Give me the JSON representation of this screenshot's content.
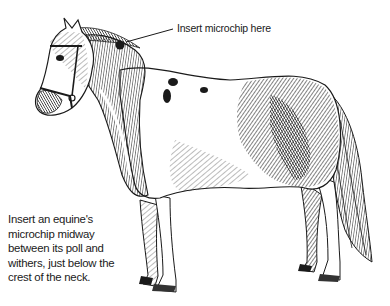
{
  "figure": {
    "style": "pen-and-ink hatching",
    "colors": {
      "ink": "#1a1a1a",
      "background": "#ffffff"
    },
    "callout": {
      "label": "Insert microchip here",
      "marker": "microchip-site-dot"
    },
    "caption": {
      "lines": [
        "Insert an equine's",
        "microchip midway",
        "between its poll and",
        "withers, just below the",
        "crest of the neck."
      ]
    }
  }
}
